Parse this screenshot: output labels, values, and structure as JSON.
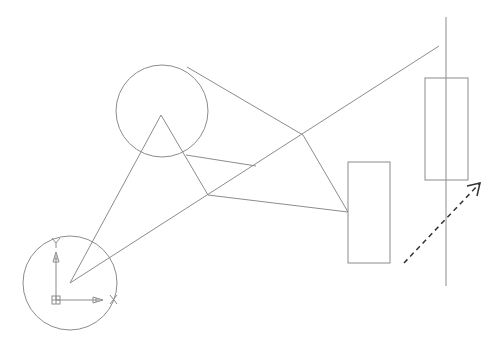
{
  "drawing": {
    "line_color": "#8c8c8c",
    "arrow_color": "#333333",
    "background": "#ffffff",
    "ucs_icon": {
      "x_label": "X",
      "y_label": "Y",
      "origin": [
        56,
        300
      ]
    },
    "circles": [
      {
        "name": "small-circle",
        "cx": 70,
        "cy": 283,
        "r": 47
      },
      {
        "name": "large-circle",
        "cx": 162,
        "cy": 111,
        "r": 46
      }
    ],
    "rectangles": [
      {
        "name": "rect-lower",
        "x": 348,
        "y": 162,
        "w": 42,
        "h": 101
      },
      {
        "name": "rect-upper",
        "x": 425,
        "y": 78,
        "w": 43,
        "h": 102
      }
    ],
    "lines": [
      {
        "name": "triangle-left-edge",
        "x1": 70,
        "y1": 283,
        "x2": 161,
        "y2": 115
      },
      {
        "name": "triangle-right-edge",
        "x1": 161,
        "y1": 115,
        "x2": 208,
        "y2": 195
      },
      {
        "name": "long-diagonal",
        "x1": 70,
        "y1": 283,
        "x2": 439,
        "y2": 46
      },
      {
        "name": "tangent-line",
        "x1": 187,
        "y1": 67,
        "x2": 303,
        "y2": 135
      },
      {
        "name": "link-a-to-rect",
        "x1": 303,
        "y1": 135,
        "x2": 348,
        "y2": 212
      },
      {
        "name": "link-b-to-rect",
        "x1": 208,
        "y1": 195,
        "x2": 348,
        "y2": 212
      },
      {
        "name": "short-link",
        "x1": 186,
        "y1": 155,
        "x2": 256,
        "y2": 166
      },
      {
        "name": "vertical-axis",
        "x1": 446,
        "y1": 17,
        "x2": 446,
        "y2": 286
      }
    ],
    "dashed_arrow": {
      "x1": 404,
      "y1": 263,
      "x2": 480,
      "y2": 183
    }
  }
}
